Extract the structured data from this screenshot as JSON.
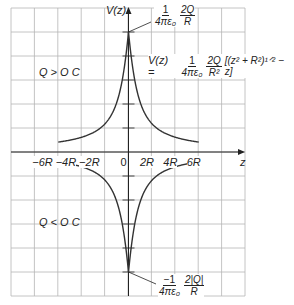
{
  "chart_data": {
    "type": "line",
    "title": "",
    "xlabel": "z",
    "ylabel": "V(z)",
    "x_ticks": [
      "-6R",
      "-4R",
      "-2R",
      "0",
      "2R",
      "4R",
      "6R"
    ],
    "xlim": [
      -6,
      6
    ],
    "ylim_normalized": [
      -1,
      1
    ],
    "grid": true,
    "series": [
      {
        "name": "Q > 0 C",
        "z_over_R": [
          -6,
          -5,
          -4,
          -3,
          -2,
          -1,
          -0.5,
          0,
          0.5,
          1,
          2,
          3,
          4,
          5,
          6
        ],
        "V_over_Vmax": [
          0.083,
          0.099,
          0.123,
          0.162,
          0.236,
          0.414,
          0.618,
          1.0,
          0.618,
          0.414,
          0.236,
          0.162,
          0.123,
          0.099,
          0.083
        ]
      },
      {
        "name": "Q < 0 C",
        "z_over_R": [
          -6,
          -5,
          -4,
          -3,
          -2,
          -1,
          -0.5,
          0,
          0.5,
          1,
          2,
          3,
          4,
          5,
          6
        ],
        "V_over_Vmax": [
          -0.083,
          -0.099,
          -0.123,
          -0.162,
          -0.236,
          -0.414,
          -0.618,
          -1.0,
          -0.618,
          -0.414,
          -0.236,
          -0.162,
          -0.123,
          -0.099,
          -0.083
        ]
      }
    ],
    "annotations": [
      "V(z) = 1/(4πε0) · 2Q/R² [(z² + R²)^(1/2) − z]",
      "Peak: 1/(4πε0) · 2Q/R",
      "Minimum: −1/(4πε0) · 2|Q|/R",
      "Q > O C",
      "Q < O C"
    ]
  },
  "labels": {
    "y_axis": "V(z)",
    "x_axis": "z",
    "region_pos": "Q > O C",
    "region_neg": "Q < O C",
    "ticks": [
      "−6R",
      "−4R",
      "−2R",
      "0",
      "2R",
      "4R",
      "6R"
    ],
    "formula": {
      "lhs": "V(z) =",
      "frac1_num": "1",
      "frac1_den": "4πε₀",
      "frac2_num": "2Q",
      "frac2_den": "R²",
      "bracket": "[(z² + R²)¹ᐟ² − z]"
    },
    "peak": {
      "frac1_num": "1",
      "frac1_den": "4πε₀",
      "frac2_num": "2Q",
      "frac2_den": "R"
    },
    "trough": {
      "frac1_num": "−1",
      "frac1_den": "4πε₀",
      "frac2_num": "2|Q|",
      "frac2_den": "R"
    }
  }
}
